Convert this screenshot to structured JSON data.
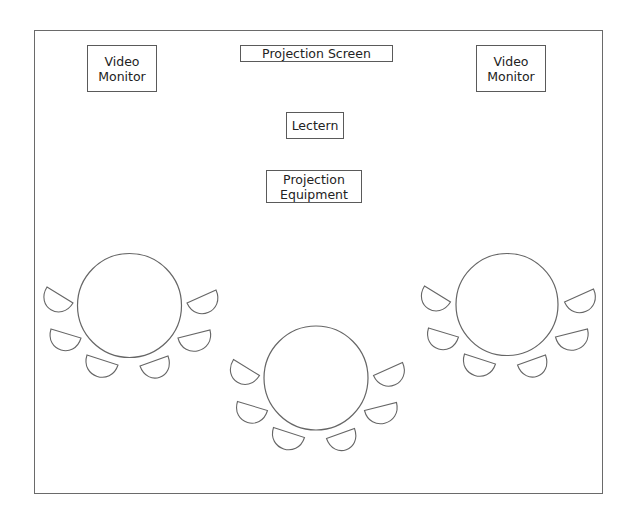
{
  "diagram": {
    "type": "room-layout",
    "room": {
      "x": 34,
      "y": 30,
      "w": 569,
      "h": 464
    },
    "fixtures": [
      {
        "id": "video-monitor-left",
        "label": "Video\nMonitor",
        "x": 87,
        "y": 45,
        "w": 70,
        "h": 47
      },
      {
        "id": "projection-screen",
        "label": "Projection Screen",
        "x": 240,
        "y": 45,
        "w": 153,
        "h": 17
      },
      {
        "id": "video-monitor-right",
        "label": "Video\nMonitor",
        "x": 476,
        "y": 45,
        "w": 70,
        "h": 47
      },
      {
        "id": "lectern",
        "label": "Lectern",
        "x": 286,
        "y": 112,
        "w": 58,
        "h": 27
      },
      {
        "id": "projection-equipment",
        "label": "Projection\nEquipment",
        "x": 266,
        "y": 170,
        "w": 96,
        "h": 33
      }
    ],
    "tables": [
      {
        "id": "table-left",
        "cx": 129.5,
        "cy": 305.5,
        "r": 52
      },
      {
        "id": "table-center",
        "cx": 316,
        "cy": 378,
        "r": 52
      },
      {
        "id": "table-right",
        "cx": 507,
        "cy": 304.5,
        "r": 51
      }
    ],
    "chairs_per_table": 6,
    "chair_offsets": [
      {
        "ax": -82.5,
        "ay": -18.5,
        "bx": -56.5,
        "by": -2.5
      },
      {
        "ax": -78.5,
        "ay": 23.5,
        "bx": -48.5,
        "by": 32.5
      },
      {
        "ax": -42.5,
        "ay": 49.5,
        "bx": -11.5,
        "by": 59.5
      },
      {
        "ax": 10.5,
        "ay": 60.5,
        "bx": 38.5,
        "by": 50.5
      },
      {
        "ax": 48.5,
        "ay": 32.5,
        "bx": 80.5,
        "by": 24.5
      },
      {
        "ax": 57.5,
        "ay": -2.5,
        "bx": 86.5,
        "by": -15.5
      }
    ],
    "chair_bulge": 23
  }
}
